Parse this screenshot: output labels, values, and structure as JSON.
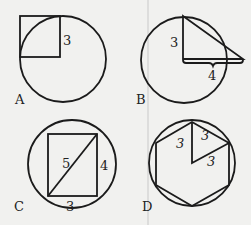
{
  "figure": {
    "panels": [
      {
        "id": "A",
        "label": "A",
        "measures": [
          "3"
        ],
        "description": "square with one corner at circle center, side 3"
      },
      {
        "id": "B",
        "label": "B",
        "measures": [
          "3",
          "4"
        ],
        "description": "right triangle with vertical leg 3 from circle center, horizontal leg 4"
      },
      {
        "id": "C",
        "label": "C",
        "measures": [
          "5",
          "4",
          "3"
        ],
        "description": "rectangle 3 by 4 inscribed in circle with diagonal 5"
      },
      {
        "id": "D",
        "label": "D",
        "measures": [
          "3",
          "3",
          "3"
        ],
        "description": "regular hexagon inscribed in circle with equilateral triangle of side 3"
      }
    ]
  }
}
